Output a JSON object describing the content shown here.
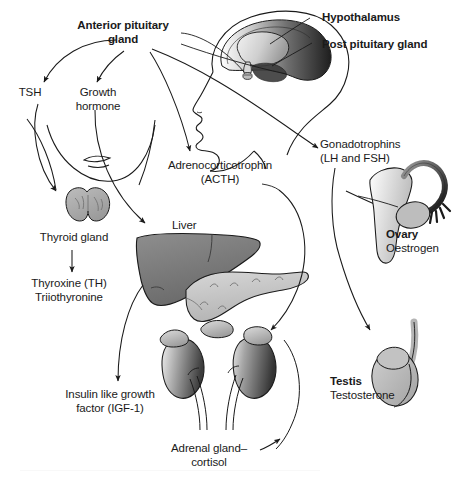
{
  "figure": {
    "background_color": "#ffffff",
    "line_color": "#1a1a1a",
    "text_color": "#1a1a1a"
  },
  "labels": {
    "anterior_pituitary": "Anterior pituitary\ngland",
    "hypothalamus": "Hypothalamus",
    "post_pituitary": "Post pituitary gland",
    "tsh": "TSH",
    "growth_hormone": "Growth\nhormone",
    "adrenocorticotrophin": "Adrenocorticotrophin\n(ACTH)",
    "gonadotrophins": "Gonadotrophins\n(LH and FSH)",
    "thyroid_gland": "Thyroid gland",
    "thyroxine": "Thyroxine (TH)\nTriiothyronine",
    "liver": "Liver",
    "igf": "Insulin like growth\nfactor (IGF-1)",
    "adrenal_gland": "Adrenal gland–\ncortisol",
    "ovary": "Ovary",
    "oestrogen": "Oestrogen",
    "testis": "Testis",
    "testosterone": "Testosterone"
  },
  "organs": [
    {
      "name": "head-brain",
      "label": "Hypothalamus / pituitary",
      "fill": "#6b6b6b"
    },
    {
      "name": "thyroid-gland",
      "label": "Thyroid gland",
      "fill": "#a8a8a8"
    },
    {
      "name": "liver",
      "label": "Liver",
      "fill": "#7d7d7d"
    },
    {
      "name": "pancreas",
      "label": "Pancreas",
      "fill": "#c4c4c4"
    },
    {
      "name": "kidney-left",
      "label": "Kidney",
      "fill": "#8a8a8a"
    },
    {
      "name": "kidney-right",
      "label": "Kidney",
      "fill": "#8a8a8a"
    },
    {
      "name": "adrenal-left",
      "label": "Adrenal gland",
      "fill": "#b5b5b5"
    },
    {
      "name": "adrenal-right",
      "label": "Adrenal gland",
      "fill": "#b5b5b5"
    },
    {
      "name": "uterus-ovary",
      "label": "Uterus and ovary",
      "fill": "#d2d2d2"
    },
    {
      "name": "testis",
      "label": "Testis",
      "fill": "#b0b0b0"
    }
  ],
  "arrows": [
    {
      "name": "arrow-ap-to-tsh",
      "from": "Anterior pituitary gland",
      "to": "TSH"
    },
    {
      "name": "arrow-ap-to-gh",
      "from": "Anterior pituitary gland",
      "to": "Growth hormone"
    },
    {
      "name": "arrow-ap-to-acth",
      "from": "Anterior pituitary gland",
      "to": "Adrenocorticotrophin (ACTH)"
    },
    {
      "name": "arrow-ap-to-gonadotrophins",
      "from": "Anterior pituitary gland",
      "to": "Gonadotrophins (LH and FSH)"
    },
    {
      "name": "arrow-tsh-to-thyroid",
      "from": "TSH",
      "to": "Thyroid gland"
    },
    {
      "name": "arrow-thyroid-to-thyroxine",
      "from": "Thyroid gland",
      "to": "Thyroxine (TH) Triiothyronine"
    },
    {
      "name": "arrow-gh-to-liver",
      "from": "Growth hormone",
      "to": "Liver"
    },
    {
      "name": "arrow-liver-to-igf",
      "from": "Liver",
      "to": "Insulin like growth factor (IGF-1)"
    },
    {
      "name": "arrow-acth-to-adrenal",
      "from": "Adrenocorticotrophin (ACTH)",
      "to": "Adrenal gland"
    },
    {
      "name": "arrow-adrenal-label",
      "from": "Adrenal gland–cortisol",
      "to": "Kidney adrenal"
    },
    {
      "name": "arrow-gonadotrophins-to-ovary",
      "from": "Gonadotrophins",
      "to": "Ovary"
    },
    {
      "name": "arrow-gonadotrophins-to-testis",
      "from": "Gonadotrophins",
      "to": "Testis"
    }
  ],
  "leader_lines": [
    {
      "name": "leader-anterior-pituitary",
      "label": "Anterior pituitary gland"
    },
    {
      "name": "leader-hypothalamus",
      "label": "Hypothalamus"
    },
    {
      "name": "leader-post-pituitary",
      "label": "Post pituitary gland"
    }
  ]
}
